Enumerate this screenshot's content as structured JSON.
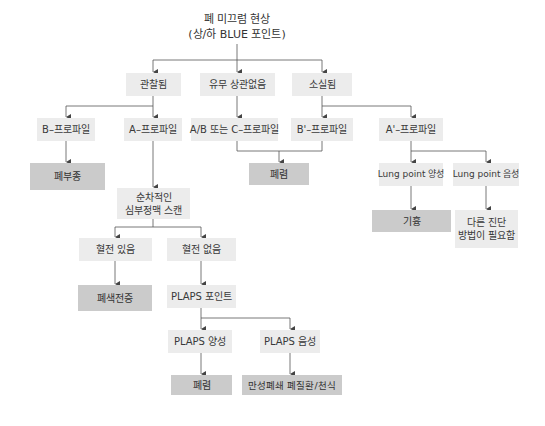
{
  "title": {
    "line1": "폐 미끄럼 현상",
    "line2": "(상/하 BLUE 포인트)"
  },
  "level1": {
    "observed": "관찰됨",
    "either": "유무 상관없음",
    "absent": "소실됨"
  },
  "profiles": {
    "b_profile": "B–프로파일",
    "a_profile": "A–프로파일",
    "ab_c_profile": "A/B 또는 C–프로파일",
    "b_prime_profile": "B'–프로파일",
    "a_prime_profile": "A'–프로파일"
  },
  "outcomes": {
    "pulmonary_edema": "폐부종",
    "pneumonia_1": "폐렴",
    "pneumothorax": "기흉",
    "pulmonary_embolism": "폐색전증",
    "pneumonia_2": "폐렴",
    "copd_asthma": "만성폐쇄 폐질환/천식"
  },
  "steps": {
    "venous_scan_line1": "순차적인",
    "venous_scan_line2": "심부정맥 스캔",
    "thrombosis_yes": "혈전 있음",
    "thrombosis_no": "혈전 없음",
    "plaps_point": "PLAPS 포인트",
    "plaps_positive": "PLAPS 양성",
    "plaps_negative": "PLAPS 음성",
    "lung_point_positive": "Lung point 양성",
    "lung_point_negative": "Lung point 음성",
    "other_dx_line1": "다른 진단",
    "other_dx_line2": "방법이 필요함"
  },
  "colors": {
    "step_box": "#ececec",
    "outcome_box": "#cbcbcb",
    "line": "#555555"
  }
}
